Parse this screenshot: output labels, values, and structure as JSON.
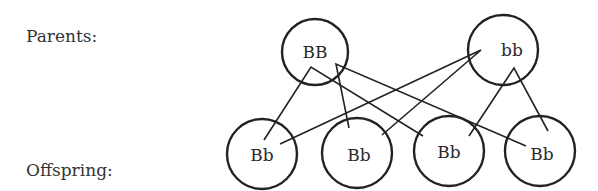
{
  "labels": {
    "parents": "Parents:",
    "offspring": "Offspring:"
  },
  "parents": [
    {
      "genotype": "BB",
      "cx": 315,
      "cy": 52,
      "r": 33
    },
    {
      "genotype": "bb",
      "cx": 503,
      "cy": 50,
      "r": 35
    }
  ],
  "offspring": [
    {
      "genotype": "Bb",
      "cx": 262,
      "cy": 154,
      "r": 35
    },
    {
      "genotype": "Bb",
      "cx": 357,
      "cy": 153,
      "r": 35
    },
    {
      "genotype": "Bb",
      "cx": 449,
      "cy": 151,
      "r": 35
    },
    {
      "genotype": "Bb",
      "cx": 540,
      "cy": 151,
      "r": 35
    }
  ],
  "colors": {
    "stroke": "#222222",
    "text": "#2a2a2a",
    "background": "#ffffff"
  }
}
